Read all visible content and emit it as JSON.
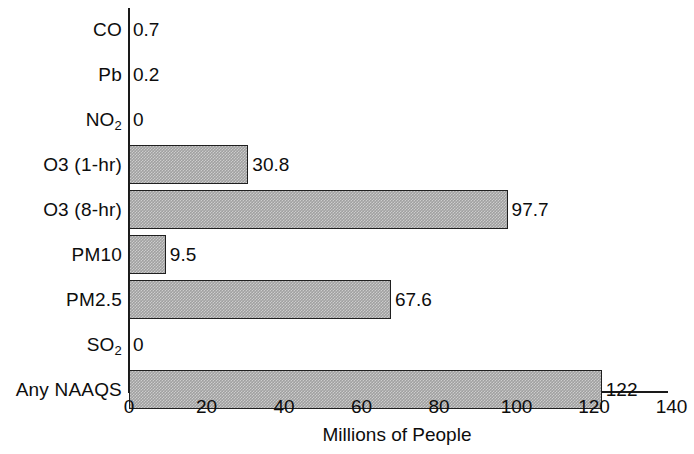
{
  "chart_data": {
    "type": "bar",
    "orientation": "horizontal",
    "title": "",
    "xlabel": "Millions of People",
    "ylabel": "",
    "xlim": [
      0,
      140
    ],
    "xticks": [
      0,
      20,
      40,
      60,
      80,
      100,
      120,
      140
    ],
    "xtick_labels": [
      "0",
      "20",
      "40",
      "60",
      "80",
      "100",
      "120",
      "140"
    ],
    "grid": false,
    "legend": null,
    "bar_color": "#a0a0a0",
    "bar_edge_color": "#1f1f1f",
    "categories": [
      "CO",
      "Pb",
      "NO2",
      "O3 (1-hr)",
      "O3 (8-hr)",
      "PM10",
      "PM2.5",
      "SO2",
      "Any NAAQS"
    ],
    "values": [
      0.7,
      0.2,
      0,
      30.8,
      97.7,
      9.5,
      67.6,
      0,
      122
    ],
    "data_labels": [
      "0.7",
      "0.2",
      "0",
      "30.8",
      "97.7",
      "9.5",
      "67.6",
      "0",
      "122"
    ]
  },
  "rows": [
    {
      "label_main": "CO",
      "label_sub": "",
      "value": 0.7,
      "data_label": "0.7"
    },
    {
      "label_main": "Pb",
      "label_sub": "",
      "value": 0.2,
      "data_label": "0.2"
    },
    {
      "label_main": "NO",
      "label_sub": "2",
      "value": 0,
      "data_label": "0"
    },
    {
      "label_main": "O3 (1-hr)",
      "label_sub": "",
      "value": 30.8,
      "data_label": "30.8"
    },
    {
      "label_main": "O3 (8-hr)",
      "label_sub": "",
      "value": 97.7,
      "data_label": "97.7"
    },
    {
      "label_main": "PM10",
      "label_sub": "",
      "value": 9.5,
      "data_label": "9.5"
    },
    {
      "label_main": "PM2.5",
      "label_sub": "",
      "value": 67.6,
      "data_label": "67.6"
    },
    {
      "label_main": "SO",
      "label_sub": "2",
      "value": 0,
      "data_label": "0"
    },
    {
      "label_main": "Any NAAQS",
      "label_sub": "",
      "value": 122,
      "data_label": "122"
    }
  ],
  "axis": {
    "title": "Millions of People",
    "ticks": [
      "0",
      "20",
      "40",
      "60",
      "80",
      "100",
      "120",
      "140"
    ]
  }
}
